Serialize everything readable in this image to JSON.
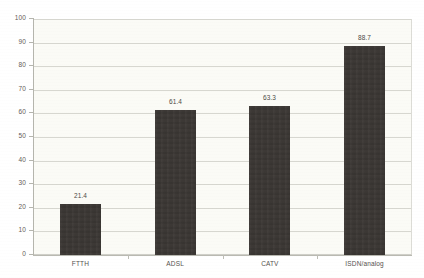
{
  "chart_data": {
    "type": "bar",
    "title": "",
    "subtitle": "",
    "xlabel": "",
    "ylabel": "",
    "categories": [
      "FTTH",
      "ADSL",
      "CATV",
      "ISDN/analog"
    ],
    "values": [
      21.4,
      61.4,
      63.3,
      88.7
    ],
    "data_labels": [
      "21.4",
      "61.4",
      "63.3",
      "88.7"
    ],
    "ylim": [
      0,
      100
    ],
    "ytick_step": 10,
    "ytick_labels": [
      "0",
      "10",
      "20",
      "30",
      "40",
      "50",
      "60",
      "70",
      "80",
      "90",
      "100"
    ],
    "grid": true,
    "grid_axis": "y",
    "legend": false,
    "legend_position": "none",
    "series": [
      {
        "name": "",
        "values": [
          21.4,
          61.4,
          63.3,
          88.7
        ]
      }
    ]
  },
  "colors": {
    "bar_fill": "#3a3633",
    "plot_background": "#fbfbf6",
    "page_background": "#ffffff",
    "gridline": "#d7d7d0",
    "axis_line": "#b5b5ad",
    "tick_label_text": "#5f5c58",
    "value_label_text": "#4c4945"
  }
}
